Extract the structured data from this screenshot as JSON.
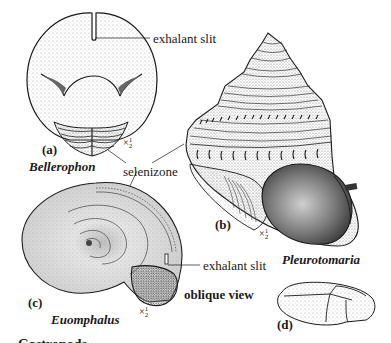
{
  "figure": {
    "panels": [
      {
        "id": "a",
        "letter": "(a)",
        "genus": "Bellerophon",
        "scale": "× ½"
      },
      {
        "id": "b",
        "letter": "(b)",
        "genus": "Pleurotomaria",
        "scale": "× ½"
      },
      {
        "id": "c",
        "letter": "(c)",
        "genus": "Euomphalus",
        "scale": "× ½"
      },
      {
        "id": "d",
        "letter": "(d)"
      }
    ],
    "annotations": {
      "exhalant_slit_top": "exhalant slit",
      "selenizone": "selenizone",
      "exhalant_slit_c": "exhalant slit",
      "oblique_view": "oblique view"
    },
    "scale_parts": {
      "times": "×",
      "num": "1",
      "den": "2"
    },
    "caption_fragment": "Gastropods ..."
  },
  "colors": {
    "ink": "#1a1a1a",
    "stipple": "#8a8a8a",
    "shade": "#5a5a5a",
    "paper": "#ffffff"
  }
}
